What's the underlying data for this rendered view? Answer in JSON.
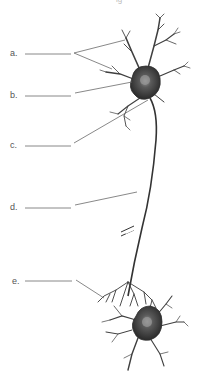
{
  "title_fragment": "ig",
  "diagram": {
    "labels": [
      {
        "letter": "a.",
        "blank": "",
        "y": 48
      },
      {
        "letter": "b.",
        "blank": "",
        "y": 90
      },
      {
        "letter": "c.",
        "blank": "",
        "y": 140
      },
      {
        "letter": "d.",
        "blank": "",
        "y": 202
      },
      {
        "letter": "e.",
        "blank": "",
        "y": 277
      }
    ],
    "colors": {
      "cell_body": "#3a3a3a",
      "nucleus": "#8a8a8a",
      "leader_line": "#6a6a6a",
      "text": "#555555"
    }
  }
}
